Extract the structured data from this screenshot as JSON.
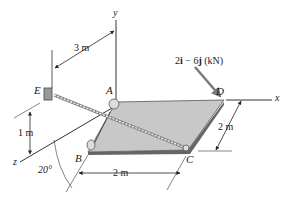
{
  "diagram": {
    "type": "3D statics free-body diagram",
    "axes": {
      "x": "x",
      "y": "y",
      "z": "z"
    },
    "points": {
      "A": "A",
      "B": "B",
      "C": "C",
      "D": "D",
      "E": "E"
    },
    "dimensions": {
      "e_to_a": "3 m",
      "e_height": "1 m",
      "plate_bc": "2 m",
      "plate_cd": "2 m",
      "angle": "20°"
    },
    "force": {
      "label": "2i − 6j (kN)",
      "i_part": "2",
      "i_unit": "i",
      "minus": " − 6",
      "j_unit": "j",
      "units": " (kN)",
      "applied_at": "D"
    },
    "elements": {
      "plate": "rectangular plate ABCD",
      "cable": "cable from E to C",
      "support_e": "wall bracket at E"
    },
    "colors": {
      "plate_fill": "#c8c8c8",
      "plate_edge": "#555555",
      "force_arrow": "#7a7a7a",
      "lines": "#333333"
    }
  }
}
